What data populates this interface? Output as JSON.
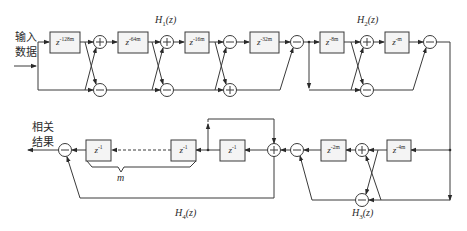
{
  "diagram": {
    "input_label_line1": "输入",
    "input_label_line2": "数据",
    "output_label_line1": "相关",
    "output_label_line2": "结果",
    "stage_labels": {
      "h1": {
        "prefix": "H",
        "sub": "1",
        "suffix": "(z)"
      },
      "h2": {
        "prefix": "H",
        "sub": "2",
        "suffix": "(z)"
      },
      "h3": {
        "prefix": "H",
        "sub": "3",
        "suffix": "(z)"
      },
      "h4": {
        "prefix": "H",
        "sub": "4",
        "suffix": "(z)"
      }
    },
    "delay_blocks": [
      {
        "id": "d128",
        "base": "z",
        "exp": "-128m"
      },
      {
        "id": "d64",
        "base": "z",
        "exp": "-64m"
      },
      {
        "id": "d16",
        "base": "z",
        "exp": "-16m"
      },
      {
        "id": "d32",
        "base": "z",
        "exp": "-32m"
      },
      {
        "id": "d8",
        "base": "z",
        "exp": "-8m"
      },
      {
        "id": "d1m",
        "base": "z",
        "exp": "-m"
      },
      {
        "id": "d4",
        "base": "z",
        "exp": "-4m"
      },
      {
        "id": "d2",
        "base": "z",
        "exp": "-2m"
      },
      {
        "id": "u1a",
        "base": "z",
        "exp": "-1"
      },
      {
        "id": "u1b",
        "base": "z",
        "exp": "-1"
      },
      {
        "id": "u1c",
        "base": "z",
        "exp": "-1"
      }
    ],
    "adder_symbols": {
      "plus": "+",
      "minus": "−"
    },
    "brace_label": "m"
  }
}
